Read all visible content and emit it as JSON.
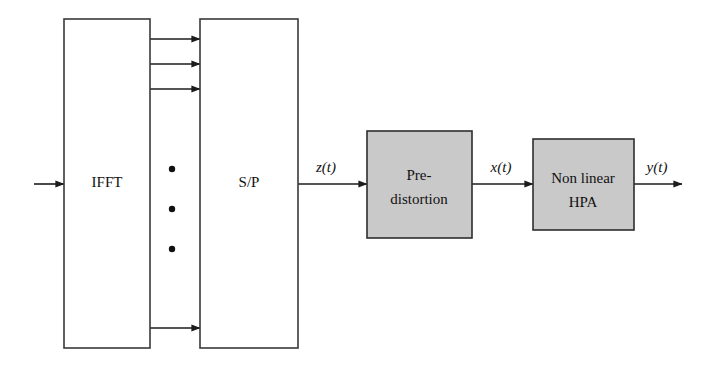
{
  "diagram": {
    "canvas": {
      "width": 708,
      "height": 368
    },
    "colors": {
      "background": "#ffffff",
      "line": "#1c1c1c",
      "plain_block_fill": "#ffffff",
      "plain_block_stroke": "#3a3a3a",
      "shaded_block_fill": "#c9c9c9",
      "shaded_block_stroke": "#2e2e2e",
      "text": "#111111"
    },
    "blocks": [
      {
        "id": "ifft",
        "label": "IFFT",
        "style": "plain",
        "x": 64,
        "y": 19,
        "width": 86,
        "height": 329,
        "label_x": 107,
        "label_y": 184
      },
      {
        "id": "sp",
        "label": "S/P",
        "style": "plain",
        "x": 200,
        "y": 19,
        "width": 98,
        "height": 329,
        "label_x": 249,
        "label_y": 184
      },
      {
        "id": "predistortion",
        "label_line1": "Pre-",
        "label_line2": "distortion",
        "style": "shaded",
        "x": 367,
        "y": 131,
        "width": 105,
        "height": 107,
        "label_x": 419,
        "label_y": 177
      },
      {
        "id": "hpa",
        "label_line1": "Non linear",
        "label_line2": "HPA",
        "style": "shaded",
        "x": 533,
        "y": 139,
        "width": 101,
        "height": 91,
        "label_x": 583,
        "label_y": 180
      }
    ],
    "signal_labels": [
      {
        "id": "z",
        "text": "z(t)",
        "x": 326,
        "y": 172
      },
      {
        "id": "x",
        "text": "x(t)",
        "x": 501,
        "y": 172
      },
      {
        "id": "y",
        "text": "y(t)",
        "x": 657,
        "y": 172
      }
    ],
    "connections": [
      {
        "id": "input-arrow",
        "from_x": 34,
        "to_x": 64,
        "y": 184,
        "arrow": true
      },
      {
        "id": "ifft-sp-1",
        "from_x": 150,
        "to_x": 200,
        "y": 39,
        "arrow": true
      },
      {
        "id": "ifft-sp-2",
        "from_x": 150,
        "to_x": 200,
        "y": 64,
        "arrow": true
      },
      {
        "id": "ifft-sp-3",
        "from_x": 150,
        "to_x": 200,
        "y": 89,
        "arrow": true
      },
      {
        "id": "ifft-sp-n",
        "from_x": 150,
        "to_x": 200,
        "y": 328,
        "arrow": true
      },
      {
        "id": "sp-predist",
        "from_x": 298,
        "to_x": 367,
        "y": 184,
        "arrow": true
      },
      {
        "id": "predist-hpa",
        "from_x": 472,
        "to_x": 533,
        "y": 184,
        "arrow": true
      },
      {
        "id": "hpa-output",
        "from_x": 634,
        "to_x": 682,
        "y": 184,
        "arrow": true
      }
    ],
    "ellipsis": {
      "id": "subcarrier-ellipsis",
      "x": 172,
      "dot_radius": 3.2,
      "dot_ys": [
        169,
        209,
        249
      ]
    }
  }
}
